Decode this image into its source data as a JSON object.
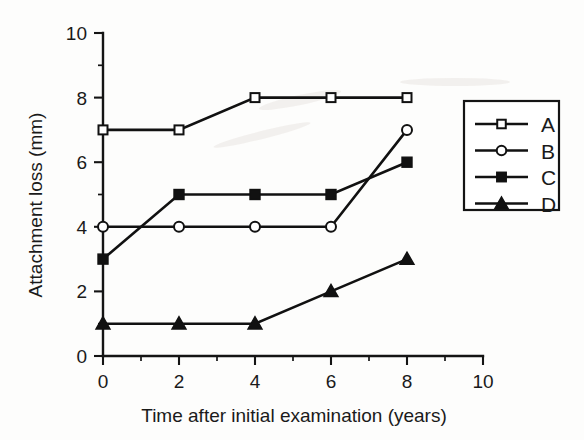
{
  "chart_data": {
    "type": "line",
    "title": "",
    "xlabel": "Time after initial examination (years)",
    "ylabel": "Attachment loss (mm)",
    "x": [
      0,
      2,
      4,
      6,
      8
    ],
    "xlim": [
      0,
      10
    ],
    "ylim": [
      0,
      10
    ],
    "x_ticks": [
      "0",
      "2",
      "4",
      "6",
      "8",
      "10"
    ],
    "x_tick_values": [
      0,
      2,
      4,
      6,
      8,
      10
    ],
    "x_minor_tick_values": [
      1,
      3,
      5,
      7,
      9
    ],
    "y_ticks": [
      "0",
      "2",
      "4",
      "6",
      "8",
      "10"
    ],
    "y_tick_values": [
      0,
      2,
      4,
      6,
      8,
      10
    ],
    "y_minor_tick_values": [
      1,
      3,
      5,
      7,
      9
    ],
    "grid": false,
    "legend_position": "right-outside",
    "series": [
      {
        "name": "A",
        "marker": "open-square",
        "values": [
          7,
          7,
          8,
          8,
          8
        ]
      },
      {
        "name": "B",
        "marker": "open-circle",
        "values": [
          4,
          4,
          4,
          4,
          7
        ]
      },
      {
        "name": "C",
        "marker": "filled-square",
        "values": [
          3,
          5,
          5,
          5,
          6
        ]
      },
      {
        "name": "D",
        "marker": "filled-triangle",
        "values": [
          1,
          1,
          1,
          2,
          3
        ]
      }
    ],
    "legend_entries": [
      {
        "label": "A",
        "marker": "open-square"
      },
      {
        "label": "B",
        "marker": "open-circle"
      },
      {
        "label": "C",
        "marker": "filled-square"
      },
      {
        "label": "D",
        "marker": "filled-triangle"
      }
    ]
  }
}
